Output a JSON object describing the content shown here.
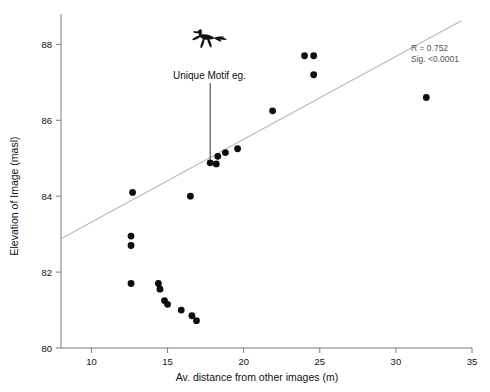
{
  "chart_data": {
    "type": "scatter",
    "title": "",
    "xlabel": "Av. distance from other images (m)",
    "ylabel": "Elevation of Image (masl)",
    "xlim": [
      8,
      35
    ],
    "ylim": [
      80,
      88.8
    ],
    "xticks": [
      10,
      15,
      20,
      25,
      30,
      35
    ],
    "yticks": [
      80,
      82,
      84,
      86,
      88
    ],
    "grid": false,
    "legend": "none",
    "points": [
      {
        "x": 12.7,
        "y": 84.1
      },
      {
        "x": 12.6,
        "y": 82.95
      },
      {
        "x": 12.6,
        "y": 82.7
      },
      {
        "x": 12.6,
        "y": 81.7
      },
      {
        "x": 14.4,
        "y": 81.7
      },
      {
        "x": 14.5,
        "y": 81.55
      },
      {
        "x": 14.8,
        "y": 81.25
      },
      {
        "x": 15.0,
        "y": 81.15
      },
      {
        "x": 15.9,
        "y": 81.0
      },
      {
        "x": 16.6,
        "y": 80.85
      },
      {
        "x": 16.9,
        "y": 80.72
      },
      {
        "x": 16.5,
        "y": 84.0
      },
      {
        "x": 17.8,
        "y": 84.88
      },
      {
        "x": 18.2,
        "y": 84.85
      },
      {
        "x": 18.3,
        "y": 85.05
      },
      {
        "x": 18.8,
        "y": 85.15
      },
      {
        "x": 19.6,
        "y": 85.25
      },
      {
        "x": 21.9,
        "y": 86.25
      },
      {
        "x": 24.0,
        "y": 87.7
      },
      {
        "x": 24.6,
        "y": 87.7
      },
      {
        "x": 24.6,
        "y": 87.2
      },
      {
        "x": 32.0,
        "y": 86.6
      }
    ],
    "fit_line": {
      "x1": 8.0,
      "y1": 82.88,
      "x2": 34.3,
      "y2": 88.62
    },
    "annotations": [
      {
        "label": "Unique Motif eg.",
        "target_x": 17.8,
        "target_y": 84.88
      }
    ],
    "statistics": {
      "r_label": "R = 0.752",
      "sig_label": "Sig. <0.0001"
    }
  },
  "icons": {
    "motif": "rock-art-motif-icon"
  }
}
